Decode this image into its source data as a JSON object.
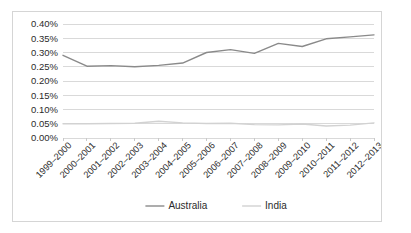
{
  "chart": {
    "type": "line",
    "background_color": "#ffffff",
    "border_color": "#d5d5d5",
    "gridline_color": "#d9d9d9"
  },
  "chart_data": {
    "type": "line",
    "title": "",
    "subtitle": "",
    "xlabel": "",
    "ylabel": "",
    "grid": true,
    "legend_position": "bottom",
    "ylim": [
      0.0,
      0.4
    ],
    "ytick_labels": [
      "0.40%",
      "0.35%",
      "0.30%",
      "0.25%",
      "0.20%",
      "0.15%",
      "0.10%",
      "0.05%",
      "0.00%"
    ],
    "ytick_values": [
      0.4,
      0.35,
      0.3,
      0.25,
      0.2,
      0.15,
      0.1,
      0.05,
      0.0
    ],
    "value_suffix": "%",
    "categories": [
      "1999–2000",
      "2000–2001",
      "2001–2002",
      "2002–2003",
      "2003–2004",
      "2004–2005",
      "2005–2006",
      "2006–2007",
      "2007–2008",
      "2008–2009",
      "2009–2010",
      "2010–2011",
      "2011–2012",
      "2012–2013"
    ],
    "series": [
      {
        "name": "Australia",
        "color": "#8a8a8a",
        "values": [
          0.29,
          0.252,
          0.254,
          0.25,
          0.255,
          0.263,
          0.3,
          0.31,
          0.297,
          0.332,
          0.321,
          0.348,
          0.355,
          0.362
        ]
      },
      {
        "name": "India",
        "color": "#d2d2d2",
        "values": [
          0.05,
          0.05,
          0.051,
          0.052,
          0.059,
          0.053,
          0.051,
          0.052,
          0.047,
          0.046,
          0.049,
          0.042,
          0.045,
          0.053
        ]
      }
    ]
  },
  "legend": {
    "items": [
      {
        "label": "Australia",
        "color": "#8a8a8a"
      },
      {
        "label": "India",
        "color": "#d2d2d2"
      }
    ]
  }
}
